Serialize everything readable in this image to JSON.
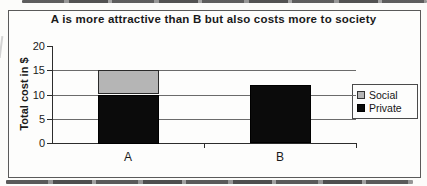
{
  "chart_data": {
    "type": "bar",
    "stacked": true,
    "title": "A is more attractive than B but also costs more to society",
    "ylabel": "Total cost in $",
    "xlabel": "",
    "categories": [
      "A",
      "B"
    ],
    "series": [
      {
        "name": "Private",
        "values": [
          10,
          12
        ],
        "color": "#0b0b0b",
        "border": "#000000"
      },
      {
        "name": "Social",
        "values": [
          5,
          0
        ],
        "color": "#b5b5b5",
        "border": "#2a2a2a"
      }
    ],
    "ylim": [
      0,
      20
    ],
    "yticks": [
      0,
      5,
      10,
      15,
      20
    ],
    "gridlines": [
      5,
      10,
      15
    ],
    "grid": "horizontal",
    "legend_position": "right"
  },
  "legend": {
    "items": [
      {
        "label": "Social",
        "color": "#b5b5b5",
        "border": "#333333"
      },
      {
        "label": "Private",
        "color": "#0a0a0a",
        "border": "#000000"
      }
    ]
  },
  "colors": {
    "axis": "#2c2c2c",
    "gridline": "#6b6b6b",
    "text": "#1a1a1a",
    "frame_border": "#5a5a5a",
    "background": "#fcfcfa"
  }
}
